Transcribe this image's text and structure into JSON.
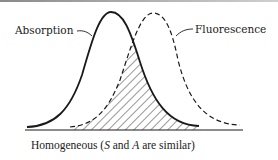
{
  "figure": {
    "caption_parts": {
      "pre": "Homogeneous (",
      "s": "S",
      "mid": " and ",
      "a": "A",
      "post": " are similar)"
    },
    "labels": {
      "absorption": "Absorption",
      "fluorescence": "Fluorescence"
    },
    "curves": [
      {
        "name": "Absorption",
        "style": "solid",
        "peak_x": 111
      },
      {
        "name": "Fluorescence",
        "style": "dashed",
        "peak_x": 153
      }
    ],
    "overlap": "hatched",
    "colors": {
      "ink": "#1a1a1a",
      "background": "#ffffff"
    }
  }
}
